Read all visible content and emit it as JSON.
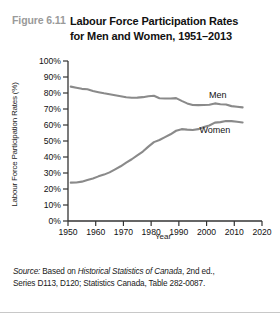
{
  "figure": {
    "number": "Figure 6.11",
    "title_line1": "Labour Force Participation Rates",
    "title_line2": "for Men and Women, 1951–2013"
  },
  "source": {
    "prefix": "Source:",
    "text_a": " Based on ",
    "italic_a": "Historical Statistics of Canada",
    "text_b": ", 2nd ed.,",
    "line2": "Series D113, D120; Statistics Canada, Table 282-0087."
  },
  "colors": {
    "line": "#8a8a8a",
    "axis": "#333333",
    "fig_number": "#9a9a9a",
    "text": "#111111"
  },
  "chart_data": {
    "type": "line",
    "title": "Labour Force Participation Rates for Men and Women, 1951–2013",
    "xlabel": "Year",
    "ylabel": "Labour Force Participation Rates (%)",
    "xlim": [
      1950,
      2020
    ],
    "ylim": [
      0,
      100
    ],
    "xticks": [
      1950,
      1960,
      1970,
      1980,
      1990,
      2000,
      2010,
      2020
    ],
    "xticklabels": [
      "1950",
      "1960",
      "1970",
      "1980",
      "1990",
      "2000",
      "2010",
      "2020"
    ],
    "yticks": [
      0,
      10,
      20,
      30,
      40,
      50,
      60,
      70,
      80,
      90,
      100
    ],
    "yticklabels": [
      "0%",
      "10%",
      "20%",
      "30%",
      "40%",
      "50%",
      "60%",
      "70%",
      "80%",
      "90%",
      "100%"
    ],
    "grid": false,
    "legend": "inline-annotations",
    "annotations": [
      {
        "label": "Men",
        "x": 2004,
        "y": 77
      },
      {
        "label": "Women",
        "x": 2003,
        "y": 55
      }
    ],
    "series": [
      {
        "name": "Men",
        "x": [
          1951,
          1953,
          1955,
          1957,
          1959,
          1961,
          1963,
          1965,
          1967,
          1969,
          1971,
          1973,
          1975,
          1977,
          1979,
          1981,
          1983,
          1985,
          1987,
          1989,
          1991,
          1993,
          1995,
          1997,
          1999,
          2001,
          2003,
          2005,
          2007,
          2009,
          2011,
          2013
        ],
        "y": [
          84.0,
          83.3,
          82.6,
          82.3,
          81.2,
          80.5,
          79.8,
          79.2,
          78.6,
          78.0,
          77.3,
          77.0,
          77.1,
          77.4,
          78.0,
          78.3,
          76.7,
          76.6,
          76.6,
          76.8,
          75.1,
          73.5,
          72.5,
          72.4,
          72.5,
          72.7,
          73.5,
          73.0,
          72.8,
          71.8,
          71.4,
          71.0
        ]
      },
      {
        "name": "Women",
        "x": [
          1951,
          1953,
          1955,
          1957,
          1959,
          1961,
          1963,
          1965,
          1967,
          1969,
          1971,
          1973,
          1975,
          1977,
          1979,
          1981,
          1983,
          1985,
          1987,
          1989,
          1991,
          1993,
          1995,
          1997,
          1999,
          2001,
          2003,
          2005,
          2007,
          2009,
          2011,
          2013
        ],
        "y": [
          24.0,
          24.1,
          24.6,
          25.6,
          26.6,
          27.9,
          29.0,
          30.4,
          32.3,
          34.2,
          36.5,
          38.6,
          41.0,
          43.4,
          46.5,
          49.3,
          50.6,
          52.4,
          54.2,
          56.4,
          57.4,
          57.1,
          56.9,
          57.4,
          58.7,
          59.7,
          61.5,
          61.8,
          62.5,
          62.4,
          62.0,
          61.6
        ]
      }
    ]
  }
}
